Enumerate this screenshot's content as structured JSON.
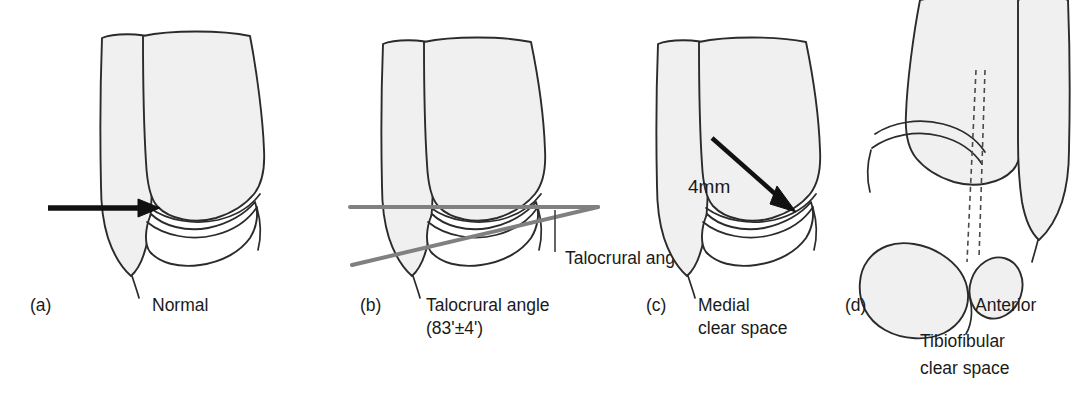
{
  "figure": {
    "type": "medical-illustration",
    "background_color": "#ffffff",
    "bone_fill_color": "#f0f0f0",
    "bone_outline_color": "#2b2b2b",
    "measurement_line_color": "#808080",
    "arrow_color": "#111111",
    "panel_count": 4
  },
  "panels": [
    {
      "tag": "(a)",
      "caption_lines": [
        "Normal"
      ],
      "annotations": [],
      "view": "mortise",
      "marker": "arrow pointing right at medial clear space"
    },
    {
      "tag": "(b)",
      "caption_lines": [
        "Talocrural angle",
        "(83'±4')"
      ],
      "annotations": [
        "Talocrural angle"
      ],
      "view": "mortise",
      "marker": "horizontal tibial plafond line and oblique intermalleolar line"
    },
    {
      "tag": "(c)",
      "caption_lines": [
        "Medial",
        "clear space"
      ],
      "annotations": [
        "4mm"
      ],
      "view": "mortise",
      "marker": "diagonal arrow into medial clear space"
    },
    {
      "tag": "(d)",
      "caption_lines": [
        "Anterior",
        "Tibiofibular",
        "clear space"
      ],
      "annotations": [],
      "view": "mortise with axial cross-section",
      "marker": "dashed vertical projection lines to axial section"
    }
  ],
  "labels": {
    "tag_a": "(a)",
    "tag_b": "(b)",
    "tag_c": "(c)",
    "tag_d": "(d)",
    "caption_a_1": "Normal",
    "caption_b_1": "Talocrural angle",
    "caption_b_2": "(83'±4')",
    "caption_c_1": "Medial",
    "caption_c_2": "clear space",
    "caption_d_1": "Anterior",
    "caption_d_2": "Tibiofibular",
    "caption_d_3": "clear space",
    "annot_talocrural": "Talocrural angle",
    "annot_4mm": "4mm"
  }
}
